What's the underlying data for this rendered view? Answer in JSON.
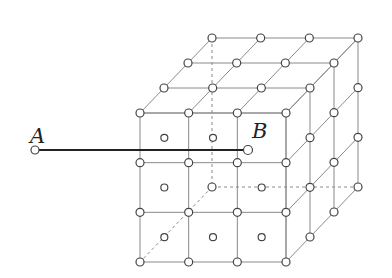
{
  "diagram": {
    "type": "cubic-lattice",
    "grid_divisions": 3,
    "labels": {
      "A": "A",
      "B": "B"
    },
    "points": {
      "A": [
        35,
        150
      ],
      "B": [
        248,
        150
      ]
    },
    "colors": {
      "lattice_line": "#8a8a8a",
      "segment_line": "#222222",
      "node_stroke": "#444444",
      "node_fill": "#ffffff",
      "hidden_line": "#8a8a8a"
    },
    "geometry": {
      "front_origin": [
        140,
        113
      ],
      "front_size": 146,
      "front_height": 149,
      "depth_offset": [
        72,
        -75
      ]
    }
  }
}
